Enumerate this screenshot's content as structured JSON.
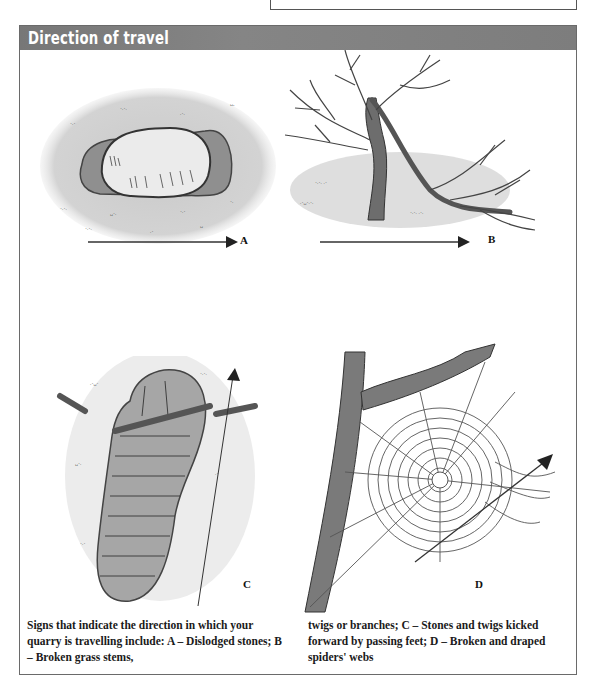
{
  "header": {
    "title": "Direction of travel",
    "bar_color": "#7c7c7c",
    "title_color": "#ffffff"
  },
  "panels": [
    {
      "id": "A",
      "label": "A",
      "depicts": "dislodged-stone",
      "arrow_direction": "right"
    },
    {
      "id": "B",
      "label": "B",
      "depicts": "broken-grass-stems-twigs",
      "arrow_direction": "right"
    },
    {
      "id": "C",
      "label": "C",
      "depicts": "footprint-with-kicked-twigs",
      "arrow_direction": "up"
    },
    {
      "id": "D",
      "label": "D",
      "depicts": "broken-spider-web",
      "arrow_direction": "up-right"
    }
  ],
  "caption": {
    "left": "Signs that indicate the direction in which your quarry is travelling include: A – Dislodged stones; B – Broken grass stems,",
    "right": "twigs or branches; C – Stones and twigs kicked forward by passing feet; D – Broken and draped spiders' webs"
  }
}
